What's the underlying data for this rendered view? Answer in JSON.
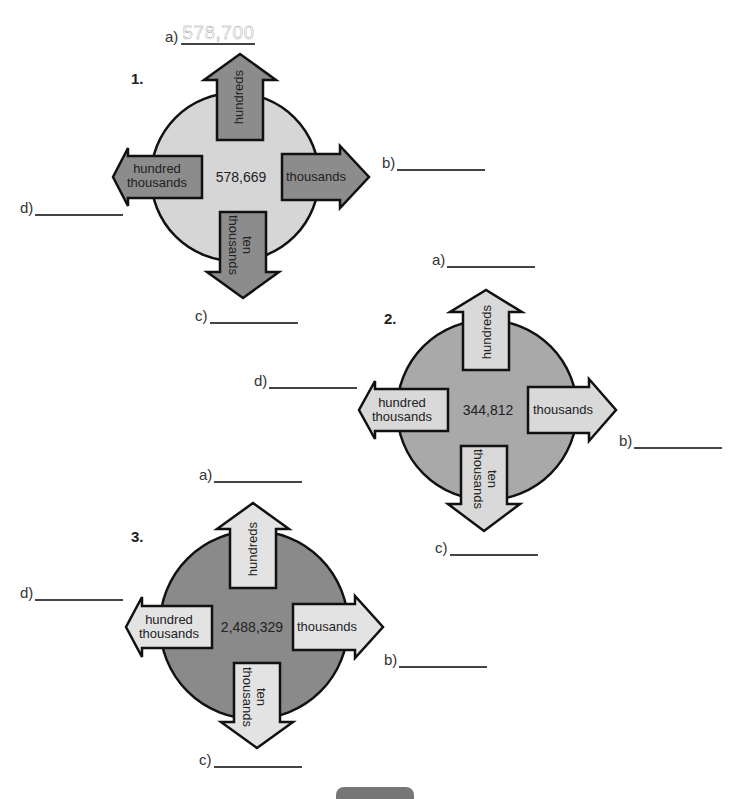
{
  "problems": [
    {
      "number": "1.",
      "center_value": "578,669",
      "circle_color": "#d6d6d6",
      "arrow_color": "#8c8c8c",
      "arrows": {
        "up": "hundreds",
        "right": "thousands",
        "down_line1": "ten",
        "down_line2": "thousands",
        "left_line1": "hundred",
        "left_line2": "thousands"
      },
      "answers": {
        "a": {
          "label": "a)",
          "value": "578,700"
        },
        "b": {
          "label": "b)",
          "value": ""
        },
        "c": {
          "label": "c)",
          "value": ""
        },
        "d": {
          "label": "d)",
          "value": ""
        }
      }
    },
    {
      "number": "2.",
      "center_value": "344,812",
      "circle_color": "#a9a9a9",
      "arrow_color": "#d9d9d9",
      "arrows": {
        "up": "hundreds",
        "right": "thousands",
        "down_line1": "ten",
        "down_line2": "thousands",
        "left_line1": "hundred",
        "left_line2": "thousands"
      },
      "answers": {
        "a": {
          "label": "a)",
          "value": ""
        },
        "b": {
          "label": "b)",
          "value": ""
        },
        "c": {
          "label": "c)",
          "value": ""
        },
        "d": {
          "label": "d)",
          "value": ""
        }
      }
    },
    {
      "number": "3.",
      "center_value": "2,488,329",
      "circle_color": "#8a8a8a",
      "arrow_color": "#e3e3e3",
      "arrows": {
        "up": "hundreds",
        "right": "thousands",
        "down_line1": "ten",
        "down_line2": "thousands",
        "left_line1": "hundred",
        "left_line2": "thousands"
      },
      "answers": {
        "a": {
          "label": "a)",
          "value": ""
        },
        "b": {
          "label": "b)",
          "value": ""
        },
        "c": {
          "label": "c)",
          "value": ""
        },
        "d": {
          "label": "d)",
          "value": ""
        }
      }
    }
  ]
}
